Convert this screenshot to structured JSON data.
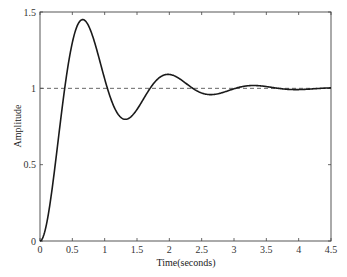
{
  "chart_data": {
    "type": "line",
    "title": "",
    "xlabel": "Time(seconds)",
    "ylabel": "Amplitude",
    "xlim": [
      0,
      4.5
    ],
    "ylim": [
      0,
      1.5
    ],
    "xticks": [
      0,
      0.5,
      1,
      1.5,
      2,
      2.5,
      3,
      3.5,
      4,
      4.5
    ],
    "xtick_labels": [
      "0",
      "0.5",
      "1",
      "1.5",
      "2",
      "2.5",
      "3",
      "3.5",
      "4",
      "4.5"
    ],
    "yticks": [
      0,
      0.5,
      1,
      1.5
    ],
    "ytick_labels": [
      "0",
      "0.5",
      "1",
      "1.5"
    ],
    "grid": false,
    "legend": null,
    "series": [
      {
        "name": "Step response",
        "style": "solid",
        "color": "#1a1a1a",
        "x": [
          0,
          0.1,
          0.2,
          0.3,
          0.4,
          0.5,
          0.6,
          0.66,
          0.7,
          0.8,
          0.9,
          1.0,
          1.1,
          1.2,
          1.3,
          1.4,
          1.5,
          1.6,
          1.7,
          1.8,
          1.9,
          1.97,
          2.1,
          2.2,
          2.3,
          2.4,
          2.5,
          2.6,
          2.7,
          2.8,
          2.9,
          3.0,
          3.1,
          3.2,
          3.3,
          3.4,
          3.5,
          3.6,
          3.7,
          3.8,
          3.9,
          4.0,
          4.1,
          4.2,
          4.3,
          4.4,
          4.5
        ],
        "values": [
          0,
          0.11,
          0.39,
          0.75,
          1.08,
          1.32,
          1.44,
          1.45,
          1.44,
          1.35,
          1.19,
          1.02,
          0.89,
          0.82,
          0.81,
          0.85,
          0.93,
          1.01,
          1.07,
          1.09,
          1.09,
          1.09,
          1.06,
          1.02,
          0.98,
          0.96,
          0.95,
          0.96,
          0.98,
          1.0,
          1.02,
          1.02,
          1.02,
          1.02,
          1.01,
          1.0,
          0.99,
          0.99,
          0.99,
          0.99,
          1.0,
          1.0,
          1.0,
          1.0,
          1.0,
          1.0,
          1.0
        ],
        "model": {
          "zeta": 0.246,
          "omega_n": 4.91
        }
      },
      {
        "name": "Final value",
        "style": "dashed",
        "color": "#555555",
        "x": [
          0,
          4.5
        ],
        "values": [
          1,
          1
        ]
      }
    ],
    "annotations": [
      {
        "label": "peak",
        "t": 0.66,
        "amplitude": 1.45
      },
      {
        "label": "first trough",
        "t": 1.3,
        "amplitude": 0.82
      },
      {
        "label": "second peak",
        "t": 1.97,
        "amplitude": 1.09
      }
    ]
  },
  "layout": {
    "plot_left": 40,
    "plot_right": 331,
    "plot_top": 12,
    "plot_bottom": 241
  }
}
